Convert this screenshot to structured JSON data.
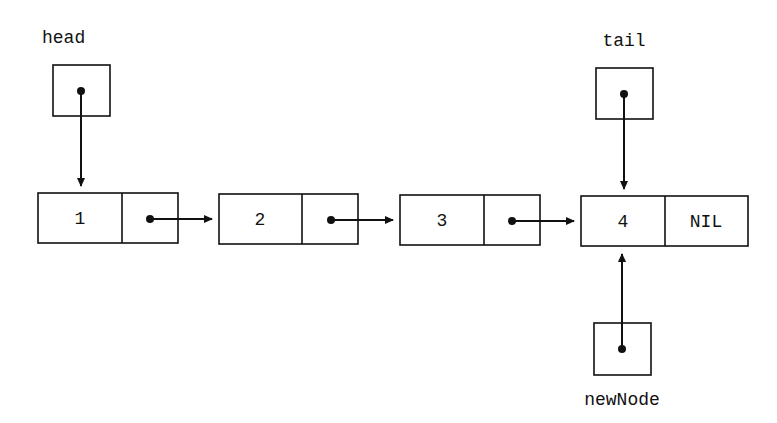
{
  "diagram": {
    "pointers": {
      "head": {
        "label": "head"
      },
      "tail": {
        "label": "tail"
      },
      "newNode": {
        "label": "newNode"
      }
    },
    "nodes": [
      {
        "value": "1",
        "next": "pointer"
      },
      {
        "value": "2",
        "next": "pointer"
      },
      {
        "value": "3",
        "next": "pointer"
      },
      {
        "value": "4",
        "next": "NIL"
      }
    ],
    "edges": [
      {
        "from": "head",
        "to": "node-1"
      },
      {
        "from": "node-1",
        "to": "node-2"
      },
      {
        "from": "node-2",
        "to": "node-3"
      },
      {
        "from": "node-3",
        "to": "node-4"
      },
      {
        "from": "tail",
        "to": "node-4"
      },
      {
        "from": "newNode",
        "to": "node-4"
      }
    ],
    "colors": {
      "stroke": "#111111",
      "background": "#ffffff"
    }
  }
}
